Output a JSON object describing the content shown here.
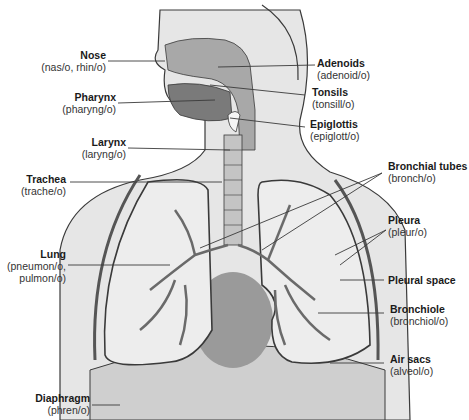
{
  "diagram": {
    "type": "anatomical-illustration",
    "colors": {
      "skin": "#e4e4e4",
      "outline": "#3a3a3a",
      "airway": "#a8a8a8",
      "mouth_dark": "#7a7a7a",
      "lung_fill": "#eeeeee",
      "heart": "#9a9a9a",
      "pleura_dark": "#555555"
    },
    "labels_left": [
      {
        "id": "nose",
        "term": "Nose",
        "root": "(nas/o, rhin/o)"
      },
      {
        "id": "pharynx",
        "term": "Pharynx",
        "root": "(pharyng/o)"
      },
      {
        "id": "larynx",
        "term": "Larynx",
        "root": "(laryng/o)"
      },
      {
        "id": "trachea",
        "term": "Trachea",
        "root": "(trache/o)"
      },
      {
        "id": "lung",
        "term": "Lung",
        "root": "(pneumon/o,",
        "root2": "pulmon/o)"
      },
      {
        "id": "diaphragm",
        "term": "Diaphragm",
        "root": "(phren/o)"
      }
    ],
    "labels_right": [
      {
        "id": "adenoids",
        "term": "Adenoids",
        "root": "(adenoid/o)"
      },
      {
        "id": "tonsils",
        "term": "Tonsils",
        "root": "(tonsill/o)"
      },
      {
        "id": "epiglottis",
        "term": "Epiglottis",
        "root": "(epiglott/o)"
      },
      {
        "id": "bronchial-tubes",
        "term": "Bronchial tubes",
        "root": "(bronch/o)"
      },
      {
        "id": "pleura",
        "term": "Pleura",
        "root": "(pleur/o)"
      },
      {
        "id": "pleural-space",
        "term": "Pleural space",
        "root": ""
      },
      {
        "id": "bronchiole",
        "term": "Bronchiole",
        "root": "(bronchiol/o)"
      },
      {
        "id": "air-sacs",
        "term": "Air sacs",
        "root": "(alveol/o)"
      }
    ]
  }
}
